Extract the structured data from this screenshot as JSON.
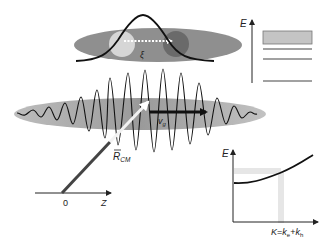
{
  "figure": {
    "exciton_panel": {
      "separation_label": "ξ",
      "electron": "light-circle",
      "hole": "dark-circle"
    },
    "wavepacket": {
      "velocity_label": "v",
      "velocity_subscript": "g"
    },
    "position_axis": {
      "vector_label": "R",
      "vector_subscript": "CM",
      "origin_label": "0",
      "axis_label": "Z"
    },
    "energy_levels": {
      "axis_label": "E",
      "levels": [
        "continuum-band",
        "level-3",
        "level-2",
        "level-1"
      ]
    },
    "dispersion": {
      "y_axis_label": "E",
      "x_axis_label": "K",
      "equals": "=",
      "k_e": "k",
      "k_e_sub": "e",
      "plus": "+",
      "k_h": "k",
      "k_h_sub": "h"
    }
  },
  "colors": {
    "ellipse_dark": "#8a8a8a",
    "ellipse_light": "#b8b8b8",
    "electron": "#d8d8d8",
    "hole": "#6e6e6e",
    "band": "#c4c4c4",
    "highlight": "#e6e6e6",
    "line": "#111111",
    "vector": "#444444"
  }
}
